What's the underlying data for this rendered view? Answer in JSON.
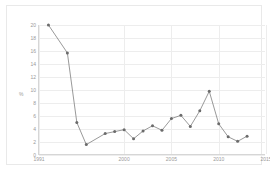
{
  "chart_data": {
    "type": "line",
    "title": "",
    "xlabel": "",
    "ylabel": "%",
    "xlim": [
      1991,
      2015
    ],
    "ylim": [
      0,
      20
    ],
    "grid": true,
    "legend": "none",
    "y_ticks": [
      0,
      2,
      4,
      6,
      8,
      10,
      12,
      14,
      16,
      18,
      20
    ],
    "x_ticks": [
      1991,
      2000,
      2005,
      2010,
      2015
    ],
    "x": [
      1992,
      1993,
      1994,
      1995,
      1996,
      1997,
      1998,
      1999,
      2000,
      2001,
      2002,
      2003,
      2004,
      2005,
      2006,
      2007,
      2008,
      2009,
      2010,
      2011,
      2012,
      2013,
      2014,
      2015
    ],
    "series": [
      {
        "name": "value",
        "values": [
          20.0,
          15.7,
          5.0,
          1.6,
          3.3,
          3.6,
          3.9,
          2.5,
          3.7,
          4.5,
          3.8,
          5.6,
          6.1,
          4.4,
          6.8,
          9.8,
          4.8,
          2.8,
          2.1,
          2.9,
          null,
          null,
          null,
          null
        ]
      }
    ],
    "points": [
      {
        "x": 1992,
        "y": 20.0
      },
      {
        "x": 1994,
        "y": 15.7
      },
      {
        "x": 1995,
        "y": 5.0
      },
      {
        "x": 1996,
        "y": 1.6
      },
      {
        "x": 1998,
        "y": 3.3
      },
      {
        "x": 1999,
        "y": 3.6
      },
      {
        "x": 2000,
        "y": 3.9
      },
      {
        "x": 2001,
        "y": 2.5
      },
      {
        "x": 2002,
        "y": 3.7
      },
      {
        "x": 2003,
        "y": 4.5
      },
      {
        "x": 2004,
        "y": 3.8
      },
      {
        "x": 2005,
        "y": 5.6
      },
      {
        "x": 2006,
        "y": 6.1
      },
      {
        "x": 2007,
        "y": 4.4
      },
      {
        "x": 2008,
        "y": 6.8
      },
      {
        "x": 2009,
        "y": 9.8
      },
      {
        "x": 2010,
        "y": 4.8
      },
      {
        "x": 2011,
        "y": 2.8
      },
      {
        "x": 2012,
        "y": 2.1
      },
      {
        "x": 2013,
        "y": 2.9
      }
    ],
    "colors": {
      "line": "#7f7f7f",
      "marker": "#6b6b6b",
      "grid": "#ededed",
      "axis": "#d6d6d6",
      "tick_text": "#9a9a9a",
      "frame": "#e9e9e9",
      "background": "#ffffff"
    }
  }
}
